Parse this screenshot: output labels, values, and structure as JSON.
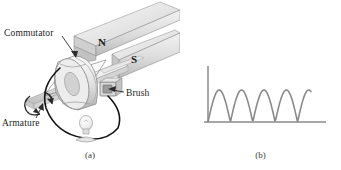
{
  "figure": {
    "background_color": "#ffffff",
    "width": 341,
    "height": 170
  },
  "panel_a": {
    "caption": "(a)",
    "title": "DC generator with commutator",
    "labels": {
      "commutator": "Commutator",
      "armature": "Armature",
      "brush": "Brush"
    },
    "magnet_poles": {
      "north": "N",
      "south": "S"
    },
    "colors": {
      "magnet_fill": "#d9d9d9",
      "magnet_edge": "#8f8f8f",
      "shaft_fill": "#ededed",
      "commutator_fill": "#e3e3e3",
      "wire": "#1a1a1a",
      "bulb_fill": "#f0f0f0",
      "leader_line": "#2b2b2b",
      "text": "#1c1c1c"
    }
  },
  "panel_b": {
    "caption": "(b)",
    "axis_labels": {
      "y": "ℰ",
      "x": "t"
    },
    "colors": {
      "axis": "#8a8a8a",
      "curve": "#8a8a8a",
      "text": "#4a4a4a"
    }
  },
  "chart_data": {
    "type": "line",
    "title": "",
    "xlabel": "t",
    "ylabel": "ℰ",
    "grid": false,
    "legend": null,
    "xlim": [
      0,
      4.6
    ],
    "ylim": [
      0,
      1.15
    ],
    "x_axis_units": "half-periods",
    "waveform": "abs_sine",
    "arches": 4.6,
    "peak_value": 1.0,
    "baseline_value": 0.0,
    "peak_positions": [
      0.5,
      1.5,
      2.5,
      3.5,
      4.5
    ],
    "zero_positions": [
      0,
      1,
      2,
      3,
      4
    ],
    "x": [
      0,
      0.25,
      0.5,
      0.75,
      1,
      1.25,
      1.5,
      1.75,
      2,
      2.25,
      2.5,
      2.75,
      3,
      3.25,
      3.5,
      3.75,
      4,
      4.25,
      4.5,
      4.6
    ],
    "y": [
      0,
      0.71,
      1.0,
      0.71,
      0,
      0.71,
      1.0,
      0.71,
      0,
      0.71,
      1.0,
      0.71,
      0,
      0.71,
      1.0,
      0.71,
      0,
      0.71,
      1.0,
      0.95
    ]
  }
}
